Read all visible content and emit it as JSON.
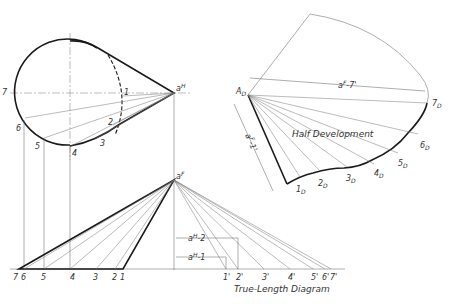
{
  "figure": {
    "top_view": {
      "apex_label": "a",
      "apex_sup": "H",
      "point_labels": [
        "1",
        "2",
        "3",
        "4",
        "5",
        "6",
        "7"
      ]
    },
    "front_view": {
      "apex_label": "a",
      "apex_sup": "F",
      "base_labels": [
        "7",
        "6",
        "5",
        "4",
        "3",
        "2",
        "1"
      ],
      "dim_a2": "a",
      "dim_a2_sup": "H",
      "dim_a2_suffix": "-2",
      "dim_a1": "a",
      "dim_a1_sup": "H",
      "dim_a1_suffix": "-1"
    },
    "true_length": {
      "title": "True-Length Diagram",
      "labels": [
        "1'",
        "2'",
        "3'",
        "4'",
        "5'",
        "6'",
        "7'"
      ]
    },
    "development": {
      "title": "Half Development",
      "apex_label": "A",
      "apex_sub": "D",
      "dim_top": "a",
      "dim_top_sup": "F",
      "dim_top_suffix": "-7'",
      "dim_side": "a",
      "dim_side_sup": "F",
      "dim_side_suffix": "-1'",
      "point_labels": [
        "1",
        "2",
        "3",
        "4",
        "5",
        "6",
        "7"
      ],
      "point_sub": "D"
    }
  }
}
